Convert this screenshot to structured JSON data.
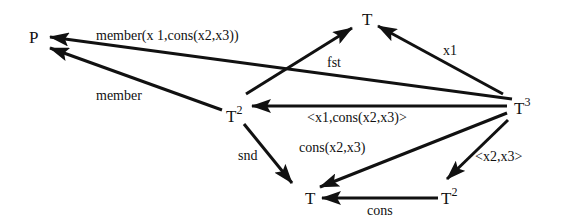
{
  "diagram": {
    "type": "commutative-diagram",
    "nodes": [
      {
        "id": "P",
        "label": "P",
        "sup": "",
        "x": 36,
        "y": 37
      },
      {
        "id": "T_top",
        "label": "T",
        "sup": "",
        "x": 369,
        "y": 20
      },
      {
        "id": "T2_left",
        "label": "T",
        "sup": "2",
        "x": 236,
        "y": 115
      },
      {
        "id": "T3",
        "label": "T",
        "sup": "3",
        "x": 523,
        "y": 108
      },
      {
        "id": "T_bottom",
        "label": "T",
        "sup": "",
        "x": 313,
        "y": 194
      },
      {
        "id": "T2_bottom",
        "label": "T",
        "sup": "2",
        "x": 452,
        "y": 194
      }
    ],
    "edges": [
      {
        "from": "T3",
        "to": "P",
        "label": "member(x 1,cons(x2,x3))"
      },
      {
        "from": "T2_left",
        "to": "P",
        "label": "member"
      },
      {
        "from": "T2_left",
        "to": "T_top",
        "label": "fst"
      },
      {
        "from": "T3",
        "to": "T_top",
        "label": "x1"
      },
      {
        "from": "T3",
        "to": "T2_left",
        "label": "<x1,cons(x2,x3)>"
      },
      {
        "from": "T2_left",
        "to": "T_bottom",
        "label": "snd"
      },
      {
        "from": "T3",
        "to": "T_bottom",
        "label": "cons(x2,x3)"
      },
      {
        "from": "T3",
        "to": "T2_bottom",
        "label": "<x2,x3>"
      },
      {
        "from": "T2_bottom",
        "to": "T_bottom",
        "label": "cons"
      }
    ]
  }
}
